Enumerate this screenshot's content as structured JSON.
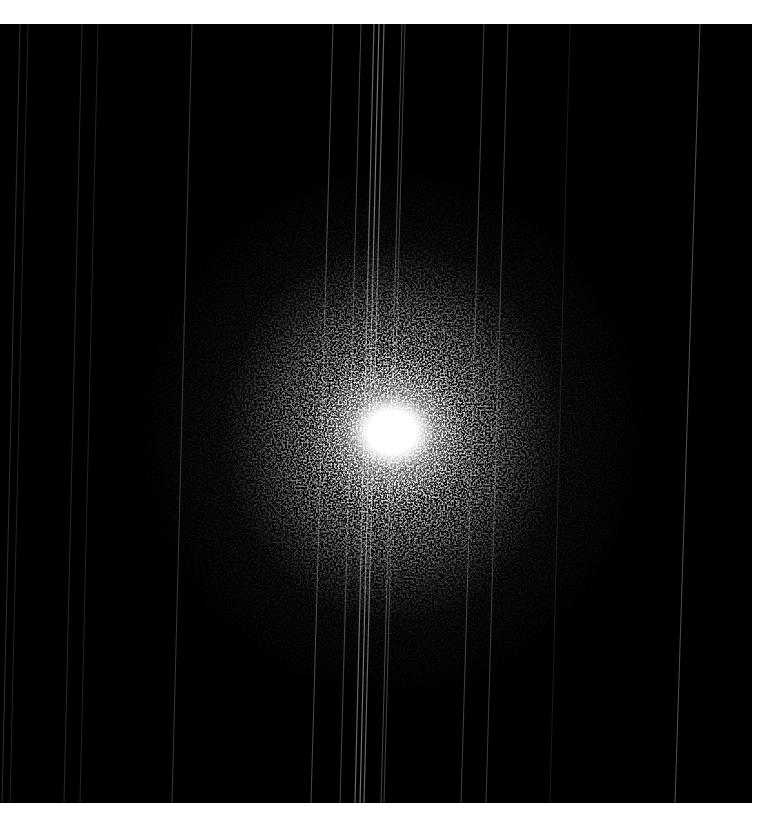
{
  "image": {
    "description": "Grayscale scientific image: bright diffuse central spot with grainy halo on black background, crossed by faint near-vertical streaks",
    "background_color": "#000000",
    "page_background_color": "#ffffff",
    "panel": {
      "x": 0,
      "y": 24,
      "width": 752,
      "height": 779
    },
    "spot": {
      "center_x": 392,
      "center_y": 408,
      "core_radius": 38,
      "halo_radius_x": 170,
      "halo_radius_y": 190,
      "outer_radius": 260,
      "core_color": "#ffffff"
    },
    "streaks": [
      {
        "x_top": 20,
        "x_bottom": 2,
        "opacity": 0.18,
        "width": 1
      },
      {
        "x_top": 28,
        "x_bottom": 10,
        "opacity": 0.14,
        "width": 1
      },
      {
        "x_top": 82,
        "x_bottom": 64,
        "opacity": 0.16,
        "width": 1
      },
      {
        "x_top": 98,
        "x_bottom": 80,
        "opacity": 0.14,
        "width": 1
      },
      {
        "x_top": 192,
        "x_bottom": 172,
        "opacity": 0.22,
        "width": 1
      },
      {
        "x_top": 333,
        "x_bottom": 311,
        "opacity": 0.3,
        "width": 1
      },
      {
        "x_top": 361,
        "x_bottom": 340,
        "opacity": 0.28,
        "width": 1
      },
      {
        "x_top": 374,
        "x_bottom": 355,
        "opacity": 0.4,
        "width": 1.2
      },
      {
        "x_top": 379,
        "x_bottom": 360,
        "opacity": 0.45,
        "width": 1.2
      },
      {
        "x_top": 384,
        "x_bottom": 364,
        "opacity": 0.4,
        "width": 1.2
      },
      {
        "x_top": 402,
        "x_bottom": 381,
        "opacity": 0.28,
        "width": 1
      },
      {
        "x_top": 405,
        "x_bottom": 384,
        "opacity": 0.26,
        "width": 1
      },
      {
        "x_top": 484,
        "x_bottom": 461,
        "opacity": 0.26,
        "width": 1
      },
      {
        "x_top": 508,
        "x_bottom": 486,
        "opacity": 0.24,
        "width": 1
      },
      {
        "x_top": 570,
        "x_bottom": 550,
        "opacity": 0.1,
        "width": 1
      },
      {
        "x_top": 700,
        "x_bottom": 675,
        "opacity": 0.32,
        "width": 1
      }
    ]
  }
}
